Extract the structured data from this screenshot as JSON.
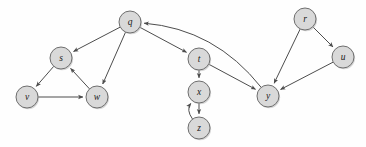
{
  "figure": {
    "background_color": "#fefefe",
    "node_fill_color": "#d9d9d9",
    "node_stroke_color": "#6e6e6e",
    "edge_color": "#4d4d4d",
    "label_color": "#1a1a1a",
    "node_radius": 11,
    "width": 366,
    "height": 147
  },
  "chart_data": {
    "type": "diagram",
    "xlabel": "",
    "ylabel": "",
    "nodes": [
      {
        "id": "q",
        "label": "q",
        "x": 130,
        "y": 22
      },
      {
        "id": "s",
        "label": "s",
        "x": 61,
        "y": 58
      },
      {
        "id": "v",
        "label": "v",
        "x": 27,
        "y": 97
      },
      {
        "id": "w",
        "label": "w",
        "x": 97,
        "y": 97
      },
      {
        "id": "t",
        "label": "t",
        "x": 199,
        "y": 59
      },
      {
        "id": "x",
        "label": "x",
        "x": 199,
        "y": 92
      },
      {
        "id": "z",
        "label": "z",
        "x": 199,
        "y": 128
      },
      {
        "id": "y",
        "label": "y",
        "x": 268,
        "y": 96
      },
      {
        "id": "r",
        "label": "r",
        "x": 305,
        "y": 19
      },
      {
        "id": "u",
        "label": "u",
        "x": 343,
        "y": 57
      }
    ],
    "edges": [
      {
        "from": "q",
        "to": "s",
        "style": "straight"
      },
      {
        "from": "q",
        "to": "w",
        "style": "straight"
      },
      {
        "from": "q",
        "to": "t",
        "style": "straight"
      },
      {
        "from": "s",
        "to": "v",
        "style": "straight"
      },
      {
        "from": "v",
        "to": "w",
        "style": "straight"
      },
      {
        "from": "w",
        "to": "s",
        "style": "straight"
      },
      {
        "from": "t",
        "to": "x",
        "style": "straight"
      },
      {
        "from": "t",
        "to": "y",
        "style": "straight"
      },
      {
        "from": "x",
        "to": "z",
        "style": "straight"
      },
      {
        "from": "z",
        "to": "x",
        "style": "curved"
      },
      {
        "from": "y",
        "to": "q",
        "style": "curved"
      },
      {
        "from": "r",
        "to": "y",
        "style": "straight"
      },
      {
        "from": "r",
        "to": "u",
        "style": "straight"
      },
      {
        "from": "u",
        "to": "y",
        "style": "straight"
      }
    ]
  }
}
